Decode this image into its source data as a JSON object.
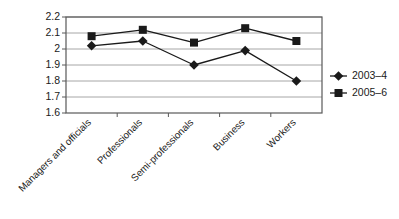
{
  "chart_data": {
    "type": "line",
    "title": "",
    "xlabel": "",
    "ylabel": "",
    "categories": [
      "Managers and officials",
      "Professionals",
      "Semi-professionals",
      "Business",
      "Workers"
    ],
    "series": [
      {
        "name": "2003–4",
        "marker": "diamond",
        "color": "#1a1a1a",
        "values": [
          2.02,
          2.05,
          1.9,
          1.99,
          1.8
        ]
      },
      {
        "name": "2005–6",
        "marker": "square",
        "color": "#1a1a1a",
        "values": [
          2.08,
          2.12,
          2.04,
          2.13,
          2.05
        ]
      }
    ],
    "ylim": [
      1.6,
      2.2
    ],
    "ytick_step": 0.1,
    "ytick_labels": [
      "2.2",
      "2.1",
      "2",
      "1.9",
      "1.8",
      "1.7",
      "1.6"
    ],
    "ytick_values": [
      2.2,
      2.1,
      2.0,
      1.9,
      1.8,
      1.7,
      1.6
    ],
    "grid": "horizontal",
    "legend_position": "right",
    "xlabel_rotation": 45,
    "colors": {
      "gridline": "#a6a6a6",
      "axis": "#595959",
      "series": "#1a1a1a",
      "background": "#ffffff"
    }
  }
}
